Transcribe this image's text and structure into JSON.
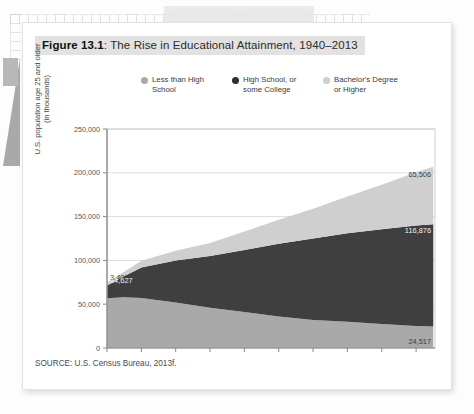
{
  "figure": {
    "number": "Figure 13.1",
    "separator": ": ",
    "title": "The Rise in Educational Attainment, 1940–2013",
    "source": "SOURCE: U.S. Census Bureau, 2013f."
  },
  "legend": [
    {
      "label": "Less than High School",
      "color": "#a9a9a9",
      "key": "less_than_hs"
    },
    {
      "label": "High School, or some College",
      "color": "#3f3f3f",
      "key": "hs_some_college"
    },
    {
      "label": "Bachelor's Degree or Higher",
      "color": "#cfcfcf",
      "key": "bachelors_plus"
    }
  ],
  "chart_data": {
    "type": "area",
    "stacked": true,
    "title": "The Rise in Educational Attainment, 1940–2013",
    "xlabel": "",
    "ylabel": "U.S. population age 25 and older (in thousands)",
    "ylim": [
      0,
      250000
    ],
    "ytick_labels": [
      "250,000",
      "200,000",
      "150,000",
      "100,000",
      "50,000",
      "0"
    ],
    "ytick_values": [
      250000,
      200000,
      150000,
      100000,
      50000,
      0
    ],
    "xtick_labels": [
      "1940",
      "1960",
      "1968",
      "1974",
      "1980",
      "1986",
      "1992",
      "1998",
      "2004",
      "2010"
    ],
    "xtick_values": [
      1940,
      1960,
      1968,
      1974,
      1980,
      1986,
      1992,
      1998,
      2004,
      2010
    ],
    "xlim": [
      1940,
      2013
    ],
    "grid": "horizontal",
    "legend_position": "top",
    "x": [
      1940,
      1950,
      1960,
      1968,
      1974,
      1980,
      1986,
      1992,
      1998,
      2004,
      2010,
      2013
    ],
    "series": [
      {
        "name": "Less than High School",
        "color": "#a9a9a9",
        "stack_order": 1,
        "values": [
          56742,
          58000,
          57000,
          52000,
          46000,
          41000,
          36000,
          32000,
          30000,
          27500,
          25200,
          24517
        ]
      },
      {
        "name": "High School, or some College",
        "color": "#3f3f3f",
        "stack_order": 2,
        "values": [
          14627,
          24000,
          35000,
          48000,
          59000,
          71000,
          83000,
          93000,
          101000,
          108000,
          114500,
          116876
        ]
      },
      {
        "name": "Bachelor's Degree or Higher",
        "color": "#cfcfcf",
        "stack_order": 3,
        "values": [
          3407,
          5000,
          7500,
          11000,
          15000,
          21000,
          27500,
          34000,
          42000,
          51000,
          61000,
          65506
        ]
      }
    ],
    "annotations": [
      {
        "text": "3,407",
        "series": "Bachelor's Degree or Higher",
        "side": "left",
        "value": 3407
      },
      {
        "text": "14,627",
        "series": "High School, or some College",
        "side": "left",
        "value": 14627
      },
      {
        "text": "56,742",
        "series": "Less than High School",
        "side": "left",
        "value": 56742
      },
      {
        "text": "65,506",
        "series": "Bachelor's Degree or Higher",
        "side": "right",
        "value": 65506
      },
      {
        "text": "116,876",
        "series": "High School, or some College",
        "side": "right",
        "value": 116876
      },
      {
        "text": "24,517",
        "series": "Less than High School",
        "side": "right",
        "value": 24517
      }
    ]
  }
}
